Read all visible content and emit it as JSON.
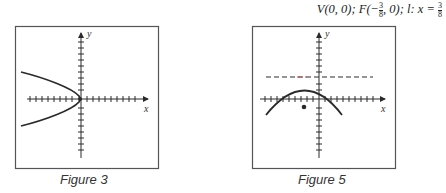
{
  "header": {
    "equation_prefix": "V(0, 0); F(−",
    "equation_mid": ", 0); l: x = ",
    "focus_frac": {
      "num": "3",
      "den": "8"
    },
    "directrix_frac": {
      "num": "3",
      "den": "8"
    }
  },
  "figures": [
    {
      "caption": "Figure 3",
      "x_label": "x",
      "y_label": "y",
      "description": "Parabola opening left with vertex at origin"
    },
    {
      "caption": "Figure 5",
      "x_label": "x",
      "y_label": "y",
      "description": "Parabola opening downward, horizontal dashed directrix above, focus point below"
    }
  ],
  "colors": {
    "stroke": "#2a2a2a",
    "frame": "#555555",
    "dash_accent": "#c0504d"
  }
}
